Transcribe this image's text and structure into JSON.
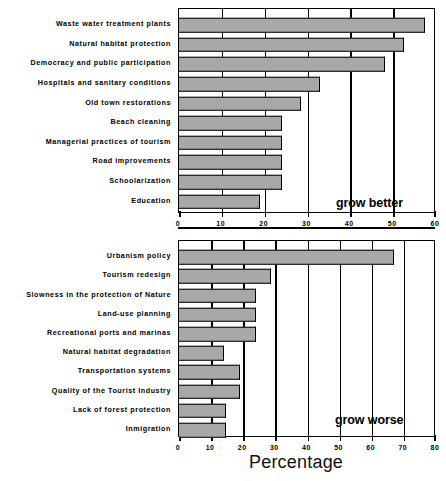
{
  "chart_data": [
    {
      "type": "bar",
      "orientation": "horizontal",
      "title": "",
      "annotation": "grow better",
      "xlabel": "",
      "ylabel": "",
      "xlim": [
        0,
        60
      ],
      "xticks": [
        0,
        10,
        20,
        30,
        40,
        50,
        60
      ],
      "xticklabels": [
        "0",
        "10",
        "20",
        "30",
        "40",
        "50",
        "60"
      ],
      "grid": true,
      "legend": "none",
      "categories": [
        "Waste water treatment plants",
        "Natural habitat protection",
        "Democracy and public participation",
        "Hospitals and sanitary conditions",
        "Old town restorations",
        "Beach cleaning",
        "Managerial practices of tourism",
        "Road improvements",
        "Schoolarization",
        "Education"
      ],
      "values": [
        57.5,
        52.5,
        48,
        33,
        28.5,
        24,
        24,
        24,
        24,
        19
      ]
    },
    {
      "type": "bar",
      "orientation": "horizontal",
      "title": "",
      "annotation": "grow worse",
      "xlabel": "Percentage",
      "ylabel": "",
      "xlim": [
        0,
        80
      ],
      "xticks": [
        0,
        10,
        20,
        30,
        40,
        50,
        60,
        70,
        80
      ],
      "xticklabels": [
        "0",
        "10",
        "20",
        "30",
        "40",
        "50",
        "60",
        "70",
        "80"
      ],
      "grid": true,
      "legend": "none",
      "categories": [
        "Urbanism policy",
        "Tourism redesign",
        "Slowness in the protection of Nature",
        "Land-use planning",
        "Recreational ports and marinas",
        "Natural habitat degradation",
        "Transportation systems",
        "Quality of the Tourist Industry",
        "Lack of forest protection",
        "Inmigration"
      ],
      "values": [
        67,
        28.5,
        24,
        24,
        24,
        14,
        19,
        19,
        14.5,
        14.5
      ]
    }
  ],
  "style": {
    "bar_fill": "#a8a8a8",
    "bar_edge": "#000000",
    "axis_color": "#000000",
    "background": "#ffffff"
  }
}
